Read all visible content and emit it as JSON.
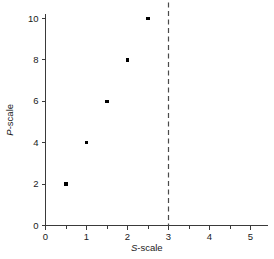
{
  "chart_data": {
    "type": "scatter",
    "title": "",
    "xlabel": "S-scale",
    "ylabel": "P-scale",
    "xlabel_italic_prefix": "S",
    "xlabel_rest": "-scale",
    "ylabel_italic_prefix": "P",
    "ylabel_rest": "-scale",
    "x": [
      0.5,
      1,
      1.5,
      2,
      2.5,
      3,
      3.5,
      4,
      4.5,
      5
    ],
    "values": [
      2,
      4,
      6,
      8,
      10,
      12,
      14,
      16,
      18,
      20
    ],
    "points": [
      {
        "x": 0.5,
        "y": 2
      },
      {
        "x": 1,
        "y": 4
      },
      {
        "x": 1.5,
        "y": 6
      },
      {
        "x": 2,
        "y": 8
      },
      {
        "x": 2.5,
        "y": 10
      },
      {
        "x": 3,
        "y": 12
      },
      {
        "x": 3.5,
        "y": 14
      },
      {
        "x": 4,
        "y": 16
      },
      {
        "x": 4.5,
        "y": 18
      },
      {
        "x": 5,
        "y": 20
      }
    ],
    "xlim": [
      0,
      5.5
    ],
    "ylim": [
      0,
      21
    ],
    "x_ticks": [
      0,
      1,
      2,
      3,
      4,
      5
    ],
    "x_tick_labels": [
      "0",
      "1",
      "2",
      "3",
      "4",
      "5"
    ],
    "x_minor_ticks": [
      0.5,
      1.5,
      2.5,
      3.5,
      4.5
    ],
    "y_ticks": [
      0,
      2,
      4,
      6,
      8,
      10,
      12,
      14,
      16,
      18,
      20
    ],
    "y_tick_labels": [
      "0",
      "2",
      "4",
      "6",
      "8",
      "10",
      "12",
      "14",
      "16",
      "18",
      "20"
    ],
    "grid": false,
    "legend": null,
    "annotations": [
      {
        "type": "guide-lines",
        "name": "dashed-guide",
        "from_y_axis_at": 12,
        "to_point": {
          "x": 3,
          "y": 12
        },
        "down_to_x_axis_at": 3,
        "style": "dashed"
      }
    ],
    "marker": "square",
    "marker_color": "#000000",
    "axis_color": "#3a3a3a",
    "guide_color": "#4a4a4a",
    "background": "#ffffff"
  }
}
